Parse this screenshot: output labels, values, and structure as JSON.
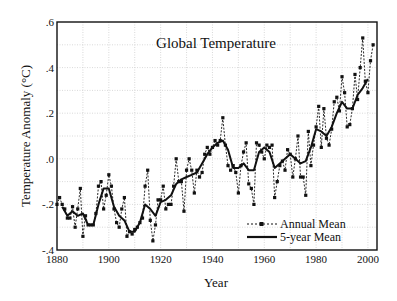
{
  "chart_data": {
    "type": "line",
    "title": "Global Temperature",
    "xlabel": "Year",
    "ylabel": "Temperature Anomaly (°C)",
    "xlim": [
      1880,
      2003.5
    ],
    "ylim": [
      -0.4,
      0.6
    ],
    "xticks": [
      1880,
      1900,
      1920,
      1940,
      1960,
      1980,
      2000
    ],
    "xtick_labels": [
      "1880",
      "1900",
      "1920",
      "1940",
      "1960",
      "1980",
      "2000"
    ],
    "yticks": [
      -0.4,
      -0.2,
      0.0,
      0.2,
      0.4,
      0.6
    ],
    "ytick_labels": [
      "-.4",
      "-.2",
      ".0",
      ".2",
      ".4",
      ".6"
    ],
    "grid": true,
    "legend_position": "lower right",
    "legend": [
      "Annual Mean",
      "5-year Mean"
    ],
    "series": [
      {
        "name": "Annual Mean",
        "style": "dashed-with-square-markers",
        "x": [
          1880,
          1881,
          1882,
          1883,
          1884,
          1885,
          1886,
          1887,
          1888,
          1889,
          1890,
          1891,
          1892,
          1893,
          1894,
          1895,
          1896,
          1897,
          1898,
          1899,
          1900,
          1901,
          1902,
          1903,
          1904,
          1905,
          1906,
          1907,
          1908,
          1909,
          1910,
          1911,
          1912,
          1913,
          1914,
          1915,
          1916,
          1917,
          1918,
          1919,
          1920,
          1921,
          1922,
          1923,
          1924,
          1925,
          1926,
          1927,
          1928,
          1929,
          1930,
          1931,
          1932,
          1933,
          1934,
          1935,
          1936,
          1937,
          1938,
          1939,
          1940,
          1941,
          1942,
          1943,
          1944,
          1945,
          1946,
          1947,
          1948,
          1949,
          1950,
          1951,
          1952,
          1953,
          1954,
          1955,
          1956,
          1957,
          1958,
          1959,
          1960,
          1961,
          1962,
          1963,
          1964,
          1965,
          1966,
          1967,
          1968,
          1969,
          1970,
          1971,
          1972,
          1973,
          1974,
          1975,
          1976,
          1977,
          1978,
          1979,
          1980,
          1981,
          1982,
          1983,
          1984,
          1985,
          1986,
          1987,
          1988,
          1989,
          1990,
          1991,
          1992,
          1993,
          1994,
          1995,
          1996,
          1997,
          1998,
          1999,
          2000,
          2001,
          2002
        ],
        "values": [
          -0.2,
          -0.17,
          -0.2,
          -0.22,
          -0.26,
          -0.26,
          -0.21,
          -0.3,
          -0.22,
          -0.13,
          -0.34,
          -0.25,
          -0.29,
          -0.29,
          -0.29,
          -0.24,
          -0.12,
          -0.1,
          -0.22,
          -0.16,
          -0.07,
          -0.12,
          -0.22,
          -0.28,
          -0.3,
          -0.22,
          -0.17,
          -0.34,
          -0.32,
          -0.33,
          -0.31,
          -0.3,
          -0.28,
          -0.26,
          -0.12,
          -0.05,
          -0.27,
          -0.36,
          -0.29,
          -0.18,
          -0.18,
          -0.12,
          -0.22,
          -0.2,
          -0.2,
          -0.12,
          0.0,
          -0.1,
          -0.1,
          -0.23,
          -0.05,
          0.0,
          -0.05,
          -0.15,
          -0.05,
          -0.08,
          -0.06,
          0.02,
          0.05,
          0.02,
          0.05,
          0.08,
          0.06,
          0.08,
          0.18,
          0.06,
          -0.03,
          -0.05,
          -0.03,
          -0.06,
          -0.15,
          -0.03,
          0.03,
          0.07,
          -0.11,
          -0.13,
          -0.2,
          0.07,
          0.06,
          0.03,
          0.0,
          0.06,
          0.05,
          0.06,
          -0.17,
          -0.1,
          -0.03,
          -0.01,
          -0.05,
          0.04,
          0.02,
          -0.08,
          0.0,
          0.1,
          -0.08,
          -0.08,
          -0.16,
          0.12,
          -0.03,
          0.06,
          0.14,
          0.23,
          0.05,
          0.22,
          0.09,
          0.06,
          0.13,
          0.25,
          0.27,
          0.21,
          0.36,
          0.29,
          0.14,
          0.15,
          0.22,
          0.37,
          0.26,
          0.4,
          0.53,
          0.34,
          0.29,
          0.43,
          0.5
        ]
      },
      {
        "name": "5-year Mean",
        "style": "solid-thick",
        "x": [
          1882,
          1884,
          1886,
          1888,
          1890,
          1892,
          1894,
          1896,
          1898,
          1900,
          1902,
          1904,
          1906,
          1908,
          1910,
          1912,
          1914,
          1916,
          1918,
          1920,
          1922,
          1924,
          1926,
          1928,
          1930,
          1932,
          1934,
          1936,
          1938,
          1940,
          1942,
          1944,
          1946,
          1948,
          1950,
          1952,
          1954,
          1956,
          1958,
          1960,
          1962,
          1964,
          1966,
          1968,
          1970,
          1972,
          1974,
          1976,
          1978,
          1980,
          1982,
          1984,
          1986,
          1988,
          1990,
          1992,
          1994,
          1996,
          1998,
          2000
        ],
        "values": [
          -0.21,
          -0.25,
          -0.23,
          -0.25,
          -0.24,
          -0.29,
          -0.29,
          -0.2,
          -0.13,
          -0.13,
          -0.21,
          -0.25,
          -0.27,
          -0.32,
          -0.32,
          -0.28,
          -0.2,
          -0.22,
          -0.25,
          -0.19,
          -0.18,
          -0.16,
          -0.11,
          -0.09,
          -0.08,
          -0.07,
          -0.06,
          -0.02,
          0.02,
          0.05,
          0.07,
          0.08,
          0.04,
          -0.04,
          -0.04,
          -0.02,
          -0.05,
          -0.05,
          0.03,
          0.05,
          0.03,
          -0.04,
          -0.02,
          0.0,
          0.02,
          0.0,
          -0.02,
          -0.01,
          0.05,
          0.13,
          0.12,
          0.1,
          0.14,
          0.2,
          0.25,
          0.22,
          0.22,
          0.28,
          0.31,
          0.35
        ]
      }
    ]
  }
}
